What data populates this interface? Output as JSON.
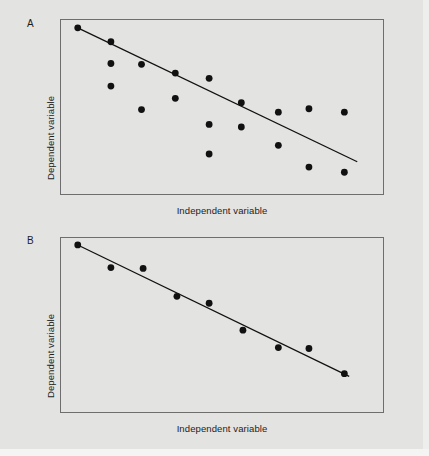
{
  "figure": {
    "background_color": "#e3e3e1",
    "width": 429,
    "height": 456
  },
  "panels": [
    {
      "tag": "A",
      "ylabel": "Dependent variable",
      "xlabel": "Independent variable"
    },
    {
      "tag": "B",
      "ylabel": "Dependent variable",
      "xlabel": "Independent variable"
    }
  ],
  "chart_data": [
    {
      "type": "scatter",
      "title": "A",
      "xlabel": "Independent variable",
      "ylabel": "Dependent variable",
      "xlim": [
        0,
        100
      ],
      "ylim": [
        0,
        100
      ],
      "grid": false,
      "legend": null,
      "annotations": [
        "A"
      ],
      "marker_color": "#111111",
      "line_color": "#111111",
      "description": "Weak negative correlation: points scattered broadly about a descending least-squares line",
      "points": [
        {
          "x": 5.2,
          "y": 95.5
        },
        {
          "x": 15.5,
          "y": 87.5
        },
        {
          "x": 15.5,
          "y": 75.0
        },
        {
          "x": 15.5,
          "y": 62.0
        },
        {
          "x": 25.0,
          "y": 74.5
        },
        {
          "x": 25.0,
          "y": 48.5
        },
        {
          "x": 35.5,
          "y": 69.5
        },
        {
          "x": 35.5,
          "y": 55.0
        },
        {
          "x": 46.0,
          "y": 66.5
        },
        {
          "x": 46.0,
          "y": 40.0
        },
        {
          "x": 46.0,
          "y": 23.0
        },
        {
          "x": 56.0,
          "y": 52.5
        },
        {
          "x": 56.0,
          "y": 38.5
        },
        {
          "x": 67.5,
          "y": 47.0
        },
        {
          "x": 67.5,
          "y": 28.0
        },
        {
          "x": 77.0,
          "y": 49.0
        },
        {
          "x": 77.0,
          "y": 15.5
        },
        {
          "x": 88.0,
          "y": 47.0
        },
        {
          "x": 88.0,
          "y": 12.5
        }
      ],
      "fit_line": {
        "x0": 5.2,
        "y0": 95.5,
        "x1": 92.0,
        "y1": 18.5
      }
    },
    {
      "type": "scatter",
      "title": "B",
      "xlabel": "Independent variable",
      "ylabel": "Dependent variable",
      "xlim": [
        0,
        100
      ],
      "ylim": [
        0,
        100
      ],
      "grid": false,
      "legend": null,
      "annotations": [
        "B"
      ],
      "marker_color": "#111111",
      "line_color": "#111111",
      "description": "Strong negative correlation: points lie tightly along a descending least-squares line",
      "points": [
        {
          "x": 5.2,
          "y": 96.0
        },
        {
          "x": 15.5,
          "y": 83.0
        },
        {
          "x": 25.5,
          "y": 82.5
        },
        {
          "x": 36.0,
          "y": 66.5
        },
        {
          "x": 46.0,
          "y": 62.5
        },
        {
          "x": 56.5,
          "y": 47.0
        },
        {
          "x": 67.5,
          "y": 37.0
        },
        {
          "x": 77.0,
          "y": 36.5
        },
        {
          "x": 88.0,
          "y": 22.0
        }
      ],
      "fit_line": {
        "x0": 5.2,
        "y0": 96.0,
        "x1": 89.5,
        "y1": 20.5
      }
    }
  ]
}
